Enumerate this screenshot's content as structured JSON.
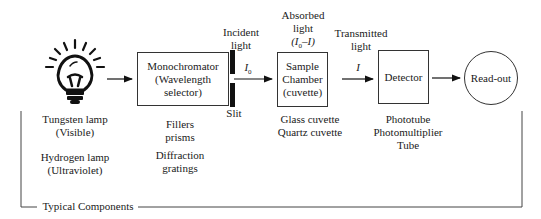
{
  "diagram": {
    "type": "spectrophotometer-block-diagram",
    "stages": [
      {
        "id": "source",
        "icon": "light-bulb-icon",
        "components": [
          [
            "Tungsten lamp",
            "(Visible)"
          ],
          [
            "Hydrogen lamp",
            "(Ultraviolet)"
          ]
        ]
      },
      {
        "id": "monochromator",
        "box_lines": [
          "Monochromator",
          "(Wavelength",
          "selector)"
        ],
        "components": [
          [
            "Fillers",
            "prisms"
          ],
          [
            "Diffraction",
            "gratings"
          ]
        ]
      },
      {
        "id": "slit",
        "label": "Slit",
        "above_label": [
          "Incident",
          "light"
        ],
        "beam_symbol": "I",
        "beam_subscript": "0"
      },
      {
        "id": "sample",
        "box_lines": [
          "Sample",
          "Chamber",
          "(cuvette)"
        ],
        "above_label": [
          "Absorbed",
          "light",
          "(I0–I)"
        ],
        "components": [
          [
            "Glass cuvette",
            "Quartz cuvette"
          ]
        ]
      },
      {
        "id": "transmitted",
        "above_label": [
          "Transmitted",
          "light"
        ],
        "beam_symbol": "I"
      },
      {
        "id": "detector",
        "box_lines": [
          "Detector"
        ],
        "components": [
          [
            "Phototube",
            "Photomultiplier",
            "Tube"
          ]
        ]
      },
      {
        "id": "readout",
        "circle_label": "Read-out"
      }
    ],
    "bracket_label": "Typical Components"
  }
}
